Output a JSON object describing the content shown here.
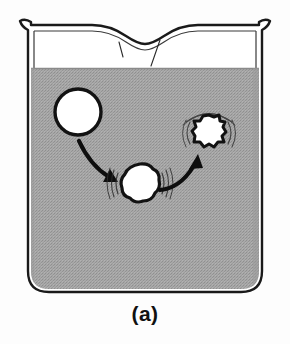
{
  "figure": {
    "caption": "(a)",
    "background_color": "#fdfdfd"
  },
  "beaker": {
    "name": "beaker",
    "glass_outline_color": "#1a1a1a",
    "glass_interior_color": "#ffffff",
    "has_pouring_spout": true,
    "spout_position": "top-center",
    "rim_flare": "both-sides",
    "bottom_corners": "rounded",
    "highlight_streaks": 2
  },
  "liquid": {
    "name": "liquid",
    "fill_color": "#a3a3a3",
    "texture": "halftone-dither",
    "surface_label": "liquid surface",
    "surface_y_fraction": 0.21
  },
  "bubbles": [
    {
      "id": "bubble-initial",
      "name": "smooth-bubble",
      "stage": "smooth spherical bubble",
      "shape": "circle",
      "fill_color": "#ffffff",
      "outline_color": "#111111",
      "has_motion_lines": false,
      "cx": 78,
      "cy": 112,
      "r": 24
    },
    {
      "id": "bubble-oscillating",
      "name": "oscillating-bubble",
      "stage": "oscillating / vibrating bubble",
      "shape": "wobbly-lobed",
      "fill_color": "#ffffff",
      "outline_color": "#111111",
      "has_motion_lines": true,
      "cx": 140,
      "cy": 183,
      "r": 19
    },
    {
      "id": "bubble-collapsing",
      "name": "collapsing-bubble",
      "stage": "collapsing / imploding bubble",
      "shape": "starburst-scalloped",
      "fill_color": "#ffffff",
      "outline_color": "#111111",
      "has_motion_lines": true,
      "cx": 209,
      "cy": 132,
      "r": 17
    }
  ],
  "arrows": [
    {
      "id": "arrow-1",
      "name": "arrow-smooth-to-oscillating",
      "from": "bubble-initial",
      "to": "bubble-oscillating",
      "direction": "down-right",
      "color": "#111111"
    },
    {
      "id": "arrow-2",
      "name": "arrow-oscillating-to-collapsing",
      "from": "bubble-oscillating",
      "to": "bubble-collapsing",
      "direction": "up-right",
      "color": "#111111"
    }
  ]
}
